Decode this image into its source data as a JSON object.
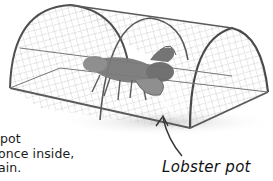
{
  "body_text": {
    "lines": [
      "pot",
      "once inside,",
      "ain."
    ]
  },
  "caption": "Lobster pot",
  "illustration": {
    "subject": "lobster-pot-with-lobster",
    "colors": {
      "wire": "#5a5a5a",
      "mesh": "#b8b8b8",
      "lobster": "#6e6e6e",
      "shadow": "#d8d8d8"
    }
  }
}
